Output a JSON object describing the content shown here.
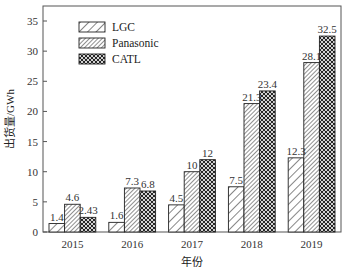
{
  "chart_data": {
    "type": "bar",
    "title": "",
    "xlabel": "年份",
    "ylabel": "出货量/GWh",
    "categories": [
      "2015",
      "2016",
      "2017",
      "2018",
      "2019"
    ],
    "series": [
      {
        "name": "LGC",
        "pattern": "sparse-diagonal",
        "values": [
          1.4,
          1.6,
          4.5,
          7.5,
          12.3
        ],
        "labels": [
          "1.4",
          "1.6",
          "4.5",
          "7.5",
          "12.3"
        ]
      },
      {
        "name": "Panasonic",
        "pattern": "dense-diagonal",
        "values": [
          4.6,
          7.3,
          10,
          21.3,
          28.1
        ],
        "labels": [
          "4.6",
          "7.3",
          "10",
          "21.3",
          "28.1"
        ]
      },
      {
        "name": "CATL",
        "pattern": "crosshatch",
        "values": [
          2.43,
          6.8,
          12,
          23.4,
          32.5
        ],
        "labels": [
          "2.43",
          "6.8",
          "12",
          "23.4",
          "32.5"
        ]
      }
    ],
    "ylim": [
      0,
      37
    ],
    "yticks": [
      0,
      5,
      10,
      15,
      20,
      25,
      30,
      35
    ],
    "grid": false,
    "legend_position": "upper-left",
    "colors": {
      "stroke": "#222222",
      "fill": "#ffffff",
      "axis": "#555555"
    }
  }
}
